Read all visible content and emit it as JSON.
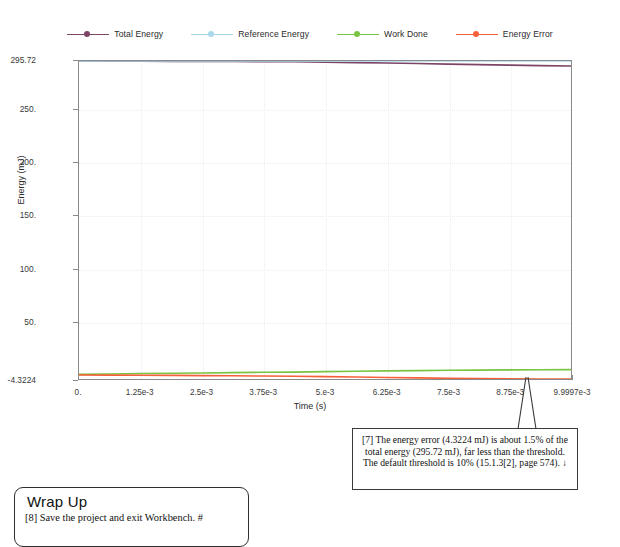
{
  "chart_data": {
    "type": "line",
    "title": "",
    "xlabel": "Time (s)",
    "ylabel": "Energy (mJ)",
    "xlim": [
      0,
      0.0099997
    ],
    "ylim": [
      -4.3224,
      295.72
    ],
    "grid": true,
    "legend_position": "top-center",
    "xticks": [
      "0.",
      "1.25e-3",
      "2.5e-3",
      "3.75e-3",
      "5.e-3",
      "6.25e-3",
      "7.5e-3",
      "8.75e-3",
      "9.9997e-3"
    ],
    "xtick_values": [
      0,
      0.00125,
      0.0025,
      0.00375,
      0.005,
      0.00625,
      0.0075,
      0.00875,
      0.0099997
    ],
    "yticks": [
      "295.72",
      "250.",
      "200.",
      "150.",
      "100.",
      "50.",
      "-4.3224"
    ],
    "ytick_values": [
      295.72,
      250,
      200,
      150,
      100,
      50,
      -4.3224
    ],
    "x": [
      0,
      0.000625,
      0.00125,
      0.001875,
      0.0025,
      0.003125,
      0.00375,
      0.004375,
      0.005,
      0.005625,
      0.00625,
      0.006875,
      0.0075,
      0.008125,
      0.00875,
      0.009375,
      0.0099997
    ],
    "series": [
      {
        "name": "Total Energy",
        "color": "#7d4466",
        "values": [
          295.72,
          295.6,
          295.5,
          295.4,
          295.3,
          295.2,
          295.1,
          295.0,
          294.6,
          294.2,
          293.8,
          293.3,
          292.8,
          292.3,
          291.8,
          291.4,
          291.0
        ]
      },
      {
        "name": "Reference Energy",
        "color": "#a8d8ea",
        "values": [
          295.72,
          295.72,
          295.72,
          295.72,
          295.72,
          295.72,
          295.72,
          295.72,
          295.72,
          295.72,
          295.72,
          295.72,
          295.72,
          295.72,
          295.72,
          295.72,
          295.72
        ]
      },
      {
        "name": "Work Done",
        "color": "#79c441",
        "values": [
          0.0,
          0.4,
          0.8,
          1.1,
          1.4,
          1.7,
          2.0,
          2.2,
          2.6,
          3.0,
          3.3,
          3.6,
          3.9,
          4.1,
          4.3,
          4.4,
          4.5
        ]
      },
      {
        "name": "Energy Error",
        "color": "#f4603a",
        "values": [
          -0.6,
          -0.7,
          -0.8,
          -0.9,
          -1.1,
          -1.3,
          -1.5,
          -1.7,
          -2.1,
          -2.5,
          -2.9,
          -3.3,
          -3.7,
          -4.0,
          -4.2,
          -4.3,
          -4.3224
        ]
      }
    ]
  },
  "legend": {
    "entries": [
      {
        "label": "Total Energy",
        "color": "#7d4466"
      },
      {
        "label": "Reference Energy",
        "color": "#a8d8ea"
      },
      {
        "label": "Work Done",
        "color": "#79c441"
      },
      {
        "label": "Energy Error",
        "color": "#f4603a"
      }
    ]
  },
  "axes": {
    "y_title": "Energy (mJ)",
    "x_title": "Time (s)",
    "y_labels": [
      "295.72",
      "250.",
      "200.",
      "150.",
      "100.",
      "50.",
      "-4.3224"
    ],
    "x_labels": [
      "0.",
      "1.25e-3",
      "2.5e-3",
      "3.75e-3",
      "5.e-3",
      "6.25e-3",
      "7.5e-3",
      "8.75e-3",
      "9.9997e-3"
    ]
  },
  "callout": {
    "text": "[7] The energy error (4.3224 mJ) is about 1.5% of the total energy (295.72 mJ), far less than the threshold. The default threshold is 10% (15.1.3[2], page 574).  ↓"
  },
  "wrapup": {
    "title": "Wrap Up",
    "text": "[8] Save the project and exit Workbench.  #"
  },
  "colors": {
    "total_energy": "#7d4466",
    "reference_energy": "#a8d8ea",
    "work_done": "#79c441",
    "energy_error": "#f4603a",
    "axis": "#8a8a8a",
    "grid": "#ededed"
  }
}
